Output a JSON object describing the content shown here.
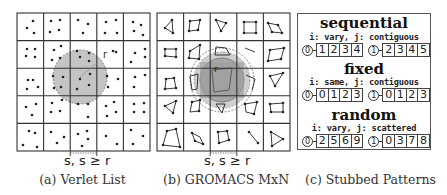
{
  "figure": {
    "panels": [
      {
        "id": "a",
        "caption": "(a) Verlet List",
        "spacing_label": "s, s ≥ r",
        "radius_label": "r",
        "grid": {
          "rows": 5,
          "cols": 5
        },
        "description": "Particles as dots in grid cells; shaded cutoff circle of radius r centered on a particle"
      },
      {
        "id": "b",
        "caption": "(b) GROMACS MxN",
        "spacing_label": "s, s ≥ r",
        "radius_label": "r",
        "grid": {
          "rows": 5,
          "cols": 5
        },
        "description": "Particle clusters drawn as polygons in grid cells; shaded cluster-pair cutoff region with dashed outer circles"
      },
      {
        "id": "c",
        "caption": "(c) Stubbed Patterns",
        "patterns": [
          {
            "title": "sequential",
            "subtitle": "i: vary, j: contiguous",
            "threads": [
              {
                "i": "0",
                "j": [
                  "1",
                  "2",
                  "3",
                  "4"
                ]
              },
              {
                "i": "1",
                "j": [
                  "2",
                  "3",
                  "4",
                  "5"
                ]
              }
            ]
          },
          {
            "title": "fixed",
            "subtitle": "i: same, j: contiguous",
            "threads": [
              {
                "i": "0",
                "j": [
                  "0",
                  "1",
                  "2",
                  "3"
                ]
              },
              {
                "i": "1",
                "j": [
                  "0",
                  "1",
                  "2",
                  "3"
                ]
              }
            ]
          },
          {
            "title": "random",
            "subtitle": "i: vary, j: scattered",
            "threads": [
              {
                "i": "0",
                "j": [
                  "2",
                  "5",
                  "6",
                  "9"
                ]
              },
              {
                "i": "1",
                "j": [
                  "0",
                  "3",
                  "7",
                  "8"
                ]
              }
            ]
          }
        ]
      }
    ]
  },
  "colors": {
    "grid_line": "#333333",
    "circle_fill": "#bdbdbd",
    "inner_fill": "#9a9a9a",
    "dot": "#222222"
  }
}
